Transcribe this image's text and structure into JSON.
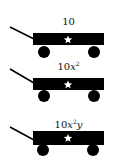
{
  "colors": {
    "background": "#ffffff",
    "wagon": "#000000",
    "star": "#ffffff",
    "text": "#111111"
  },
  "wagons": [
    {
      "label": "10",
      "coefficient": "10",
      "variable": "",
      "exponent": "",
      "variable2": "",
      "icon": "star-icon"
    },
    {
      "label": "10x²",
      "coefficient": "10",
      "variable": "x",
      "exponent": "2",
      "variable2": "",
      "icon": "star-icon"
    },
    {
      "label": "10x²y",
      "coefficient": "10",
      "variable": "x",
      "exponent": "2",
      "variable2": "y",
      "icon": "star-icon"
    }
  ]
}
